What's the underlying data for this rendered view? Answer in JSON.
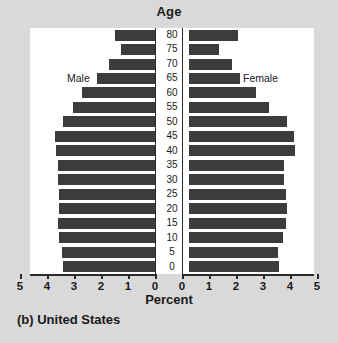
{
  "caption": "(b) United States",
  "axis_titles": {
    "top": "Age",
    "bottom": "Percent"
  },
  "side_labels": {
    "left": "Male",
    "right": "Female"
  },
  "colors": {
    "bar": "#3c3c3c",
    "panel_background": "#ffffff",
    "page_background": "#d9d9d9",
    "axis": "#2a2a2a",
    "text": "#1a1a1a"
  },
  "chart_data": {
    "type": "bar",
    "title": "(b) United States",
    "subtitle": "",
    "xlabel": "Percent",
    "ylabel": "Age",
    "orientation": "horizontal",
    "layout": "population-pyramid",
    "grid": false,
    "legend_position": "inside-top-corners",
    "xlim": [
      0,
      5
    ],
    "xticks": [
      0,
      1,
      2,
      3,
      4,
      5
    ],
    "xtick_labels_left": [
      "5",
      "4",
      "3",
      "2",
      "1",
      "0"
    ],
    "xtick_labels_right": [
      "0",
      "1",
      "2",
      "3",
      "4",
      "5"
    ],
    "categories": [
      "0",
      "5",
      "10",
      "15",
      "20",
      "25",
      "30",
      "35",
      "40",
      "45",
      "50",
      "55",
      "60",
      "65",
      "70",
      "75",
      "80"
    ],
    "category_order_top_to_bottom": [
      "80",
      "75",
      "70",
      "65",
      "60",
      "55",
      "50",
      "45",
      "40",
      "35",
      "30",
      "25",
      "20",
      "15",
      "10",
      "5",
      "0"
    ],
    "series": [
      {
        "name": "Male",
        "side": "left",
        "values": [
          3.4,
          3.45,
          3.55,
          3.6,
          3.55,
          3.55,
          3.6,
          3.6,
          3.65,
          3.7,
          3.4,
          3.05,
          2.7,
          2.15,
          1.7,
          1.25,
          1.5
        ]
      },
      {
        "name": "Female",
        "side": "right",
        "values": [
          3.55,
          3.5,
          3.7,
          3.8,
          3.85,
          3.8,
          3.75,
          3.75,
          4.15,
          4.1,
          3.85,
          3.2,
          2.7,
          2.1,
          1.8,
          1.35,
          2.05
        ]
      }
    ]
  }
}
